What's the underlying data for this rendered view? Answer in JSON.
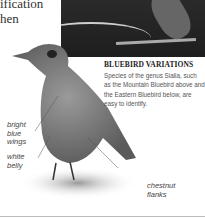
{
  "intro_text_lines": [
    "ification",
    "hen"
  ],
  "photo": {
    "alt": "Mountain Bluebird perched on branch"
  },
  "caption": {
    "title": "BLUEBIRD VARIATIONS",
    "body": "Species of the genus Sialia, such as the Mountain Bluebird above and the Eastern Bluebird below, are easy to identify."
  },
  "labels": {
    "wings": "bright blue wings",
    "belly": "white belly",
    "flanks": "chestnut flanks"
  }
}
